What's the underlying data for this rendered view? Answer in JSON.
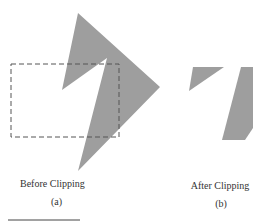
{
  "colors": {
    "polygon": "#9e9e9e",
    "window": "#555555",
    "text": "#333333",
    "rule": "#444444"
  },
  "panels": [
    {
      "caption": "Before Clipping",
      "label": "(a)"
    },
    {
      "caption": "After Clipping",
      "label": "(b)"
    }
  ]
}
